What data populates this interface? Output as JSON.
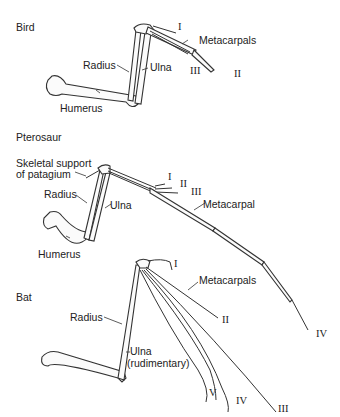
{
  "sections": [
    {
      "name": "Bird",
      "labels": {
        "radius": "Radius",
        "ulna": "Ulna",
        "humerus": "Humerus",
        "metacarpals": "Metacarpals",
        "digits": [
          "I",
          "II",
          "III"
        ]
      }
    },
    {
      "name": "Pterosaur",
      "labels": {
        "patagium_line1": "Skeletal support",
        "patagium_line2": "of patagium",
        "radius": "Radius",
        "ulna": "Ulna",
        "humerus": "Humerus",
        "metacarpal": "Metacarpal",
        "digits": [
          "I",
          "II",
          "III",
          "IV"
        ]
      }
    },
    {
      "name": "Bat",
      "labels": {
        "radius": "Radius",
        "ulna_line1": "Ulna",
        "ulna_line2": "(rudimentary)",
        "metacarpals": "Metacarpals",
        "digits": [
          "I",
          "II",
          "III",
          "IV",
          "V"
        ]
      }
    }
  ]
}
